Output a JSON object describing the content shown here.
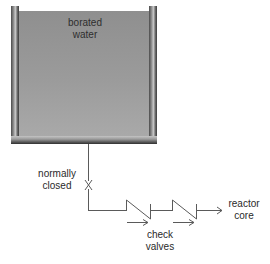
{
  "diagram": {
    "type": "piping-schematic",
    "tank": {
      "label_line1": "borated",
      "label_line2": "water",
      "water_color": "#9a9a9a",
      "wall_color": "#5a5a5a"
    },
    "isolation_valve": {
      "label_line1": "normally",
      "label_line2": "closed",
      "symbol": "gate-valve-x"
    },
    "check_valves": {
      "count": 2,
      "label_line1": "check",
      "label_line2": "valves",
      "flow_direction": "right"
    },
    "destination": {
      "label_line1": "reactor",
      "label_line2": "core"
    },
    "line_color": "#555555"
  }
}
